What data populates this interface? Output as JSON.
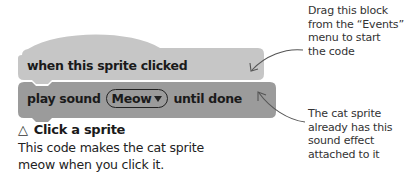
{
  "blocks": {
    "hat": {
      "label": "when this sprite clicked",
      "color": "#c4c4c4"
    },
    "play_sound": {
      "prefix": "play sound",
      "sound": "Meow",
      "suffix": "until done",
      "color": "#9a9a9a"
    }
  },
  "caption": {
    "icon": "△",
    "heading": "Click a sprite",
    "lines": [
      "This code makes the cat sprite",
      "meow when you click it."
    ]
  },
  "annotations": {
    "top": {
      "lines": [
        "Drag this block",
        "from the “Events”",
        "menu to start",
        "the code"
      ]
    },
    "bottom": {
      "lines": [
        "The cat sprite",
        "already has this",
        "sound effect",
        "attached to it"
      ]
    }
  }
}
